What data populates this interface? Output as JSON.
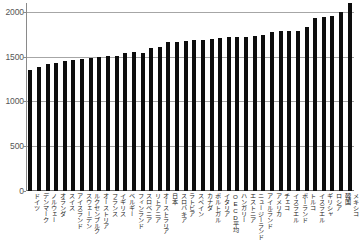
{
  "chart_data": {
    "type": "bar",
    "title": "",
    "xlabel": "",
    "ylabel": "",
    "ylim": [
      0,
      2100
    ],
    "yticks": [
      0,
      500,
      1000,
      1500,
      2000
    ],
    "ytick_labels": [
      "0",
      "500",
      "1000",
      "1500",
      "2000"
    ],
    "grid": true,
    "legend": "none",
    "bar_color": "#0d0d0d",
    "gridline_color": "#a6a6a6",
    "axis_color": "#8a8a8a",
    "note": "Last bar (Mexico) is clipped by the top of the plot area",
    "categories": [
      "ドイツ",
      "デンマーク",
      "ノルウェー",
      "オランダ",
      "スイス",
      "アイスランド",
      "スウェーデン",
      "ルクセンブルク",
      "オーストリア",
      "フランス",
      "イギリス",
      "ベルギー",
      "フィンランド",
      "スロベニア",
      "リトアニア",
      "オーストラリア",
      "日本",
      "スロバキア",
      "ラトビア",
      "スペイン",
      "カナダ",
      "ポルトガル",
      "イタリア",
      "OECD平均",
      "ハンガリー",
      "エストニア",
      "ニュージーランド",
      "アイルランド",
      "アメリカ",
      "チェコ",
      "イスラエル",
      "ポーランド",
      "トルコ",
      "イスラエル",
      "ギリシャ",
      "ロシア",
      "韓国",
      "メキシコ"
    ],
    "values": [
      1356,
      1383,
      1416,
      1430,
      1457,
      1469,
      1474,
      1482,
      1501,
      1505,
      1513,
      1538,
      1555,
      1538,
      1598,
      1613,
      1660,
      1666,
      1674,
      1687,
      1690,
      1698,
      1712,
      1716,
      1717,
      1724,
      1728,
      1744,
      1779,
      1784,
      1788,
      1792,
      1832,
      1928,
      1946,
      1960,
      2005,
      2124
    ]
  }
}
